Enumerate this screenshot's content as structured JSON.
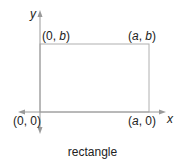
{
  "diagram": {
    "caption": "rectangle",
    "axes": {
      "x_label": "x",
      "y_label": "y"
    },
    "vertices": [
      {
        "id": "origin",
        "open": "(",
        "a": "0",
        "sep": ", ",
        "b": "0",
        "close": ")",
        "a_italic": false,
        "b_italic": false
      },
      {
        "id": "top-left",
        "open": "(",
        "a": "0",
        "sep": ", ",
        "b": "b",
        "close": ")",
        "a_italic": false,
        "b_italic": true
      },
      {
        "id": "top-right",
        "open": "(",
        "a": "a",
        "sep": ", ",
        "b": "b",
        "close": ")",
        "a_italic": true,
        "b_italic": true
      },
      {
        "id": "bottom-right",
        "open": "(",
        "a": "a",
        "sep": ", ",
        "b": "0",
        "close": ")",
        "a_italic": true,
        "b_italic": false
      }
    ],
    "colors": {
      "axis": "#9a9a9a",
      "rect": "#b0b0b0",
      "text": "#222222"
    }
  }
}
